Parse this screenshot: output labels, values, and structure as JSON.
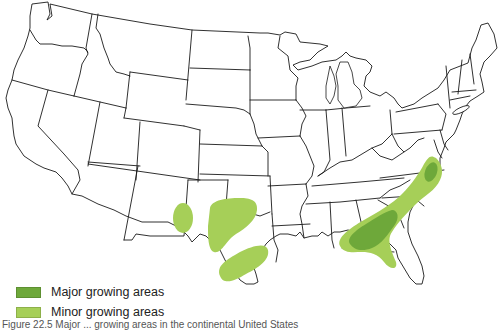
{
  "map": {
    "title": "Major and minor growing areas in the continental United States",
    "region": "Continental United States",
    "colors": {
      "major": "#6ea83a",
      "minor": "#a6cf58",
      "border": "#1a1a1a",
      "land": "#ffffff"
    },
    "growing_areas": [
      {
        "category": "minor",
        "location": "Eastern New Mexico"
      },
      {
        "category": "minor",
        "location": "Texas Panhandle / southwestern Oklahoma"
      },
      {
        "category": "minor",
        "location": "Central Texas"
      },
      {
        "category": "minor",
        "location": "Southeastern coastal plain (Alabama, Georgia, Florida panhandle, South Carolina, North Carolina, Virginia)"
      },
      {
        "category": "major",
        "location": "Southern Alabama and southwestern Georgia"
      },
      {
        "category": "major",
        "location": "Northeastern North Carolina / southeastern Virginia"
      }
    ]
  },
  "legend": {
    "items": [
      {
        "label": "Major growing areas",
        "color": "#6ea83a"
      },
      {
        "label": "Minor growing areas",
        "color": "#a6cf58"
      }
    ]
  },
  "caption": {
    "text": "Figure 22.5  Major ... growing areas in the continental United States"
  }
}
